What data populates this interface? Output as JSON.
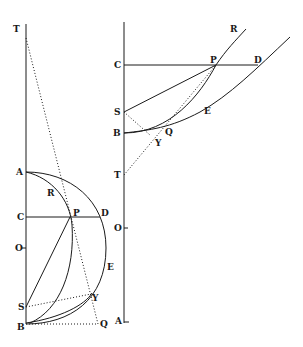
{
  "left_figure": {
    "labels": {
      "T": "T",
      "A": "A",
      "R": "R",
      "C": "C",
      "P": "P",
      "D": "D",
      "O": "O",
      "E": "E",
      "S": "S",
      "Y": "Y",
      "B": "B",
      "Q": "Q",
      "A2": "A"
    }
  },
  "right_figure": {
    "labels": {
      "R": "R",
      "C": "C",
      "P": "P",
      "D": "D",
      "S": "S",
      "B": "B",
      "Q": "Q",
      "E": "E",
      "Y": "Y",
      "T": "T",
      "O": "O",
      "A": "A"
    }
  },
  "colors": {
    "ink": "#1a1a1a",
    "background": "#ffffff"
  }
}
